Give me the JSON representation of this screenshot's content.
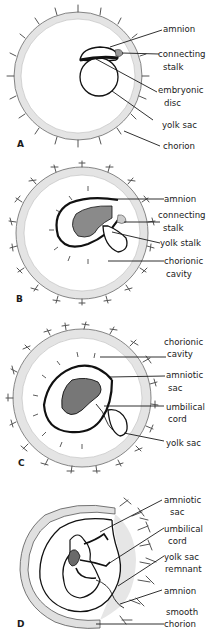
{
  "figure": {
    "panels": [
      {
        "id": "A",
        "labels": [
          {
            "lines": [
              "amnion"
            ]
          },
          {
            "lines": [
              "connecting",
              "stalk"
            ]
          },
          {
            "lines": [
              "embryonic",
              "disc"
            ]
          },
          {
            "lines": [
              "yolk sac"
            ]
          },
          {
            "lines": [
              "chorion"
            ]
          }
        ]
      },
      {
        "id": "B",
        "labels": [
          {
            "lines": [
              "amnion"
            ]
          },
          {
            "lines": [
              "connecting",
              "stalk"
            ]
          },
          {
            "lines": [
              "yolk stalk"
            ]
          },
          {
            "lines": [
              "chorionic",
              "cavity"
            ]
          }
        ]
      },
      {
        "id": "C",
        "labels": [
          {
            "lines": [
              "chorionic",
              "cavity"
            ]
          },
          {
            "lines": [
              "amniotic",
              "sac"
            ]
          },
          {
            "lines": [
              "umbilical",
              "cord"
            ]
          },
          {
            "lines": [
              "yolk sac"
            ]
          }
        ]
      },
      {
        "id": "D",
        "labels": [
          {
            "lines": [
              "amniotic",
              "sac"
            ]
          },
          {
            "lines": [
              "umbilical",
              "cord"
            ]
          },
          {
            "lines": [
              "yolk sac",
              "remnant"
            ]
          },
          {
            "lines": [
              "amnion"
            ]
          },
          {
            "lines": [
              "smooth",
              "chorion"
            ]
          }
        ]
      }
    ]
  }
}
